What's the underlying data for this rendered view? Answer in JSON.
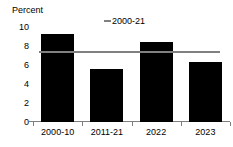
{
  "chart_data": {
    "type": "bar",
    "title": "",
    "ylabel": "Percent",
    "xlabel": "",
    "categories": [
      "2000-10",
      "2011-21",
      "2022",
      "2023"
    ],
    "values": [
      9.3,
      5.6,
      8.4,
      6.3
    ],
    "series": [
      {
        "name": "bars",
        "type": "bar",
        "color": "#000000",
        "values": [
          9.3,
          5.6,
          8.4,
          6.3
        ]
      },
      {
        "name": "2000-21",
        "type": "reference-line",
        "color": "#808080",
        "value": 7.5
      }
    ],
    "ylim": [
      0,
      10
    ],
    "yticks": [
      0,
      2,
      4,
      6,
      8,
      10
    ],
    "ytick_labels": [
      "0",
      "2",
      "4",
      "6",
      "8",
      "10"
    ],
    "grid": false,
    "legend": {
      "position": "top-center",
      "entries": [
        {
          "label": "2000-21",
          "marker": "line",
          "color": "#808080"
        }
      ]
    }
  },
  "axis": {
    "y_title": "Percent"
  }
}
